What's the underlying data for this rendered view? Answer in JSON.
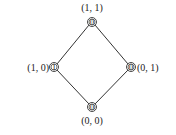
{
  "diagram": {
    "type": "lattice",
    "nodes": [
      {
        "id": "top",
        "label": "(1, 1)",
        "value": "0"
      },
      {
        "id": "left",
        "label": "(1, 0)",
        "value": "1"
      },
      {
        "id": "right",
        "label": "(0, 1)",
        "value": "0"
      },
      {
        "id": "bottom",
        "label": "(0, 0)",
        "value": "0"
      }
    ],
    "edges": [
      [
        "top",
        "left"
      ],
      [
        "top",
        "right"
      ],
      [
        "left",
        "bottom"
      ],
      [
        "right",
        "bottom"
      ]
    ],
    "colors": {
      "line": "#333333",
      "text": "#222222",
      "background": "#ffffff"
    }
  }
}
